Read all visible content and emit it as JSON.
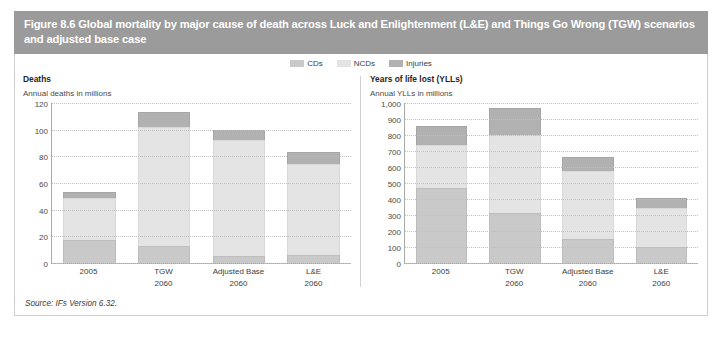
{
  "figure": {
    "header_title": "Figure 8.6 Global mortality by major cause of death across Luck and Enlightenment (L&E) and Things Go Wrong (TGW) scenarios and adjusted base case",
    "source": "Source: IFs Version 6.32.",
    "header_color": "#9b9b9b"
  },
  "legend": {
    "items": [
      {
        "label": "CDs",
        "color": "#c9c9c9"
      },
      {
        "label": "NCDs",
        "color": "#e4e4e4"
      },
      {
        "label": "Injuries",
        "color": "#b1b1b1"
      }
    ]
  },
  "chart_data": [
    {
      "type": "bar",
      "id": "deaths",
      "title": "Deaths",
      "subtitle": "Annual deaths in millions",
      "xlabel": "",
      "ylabel": "Annual deaths in millions",
      "stacked": true,
      "grid": true,
      "legend_position": "top-center",
      "ylim": [
        0,
        120
      ],
      "yticks": [
        0,
        20,
        40,
        60,
        80,
        100,
        120
      ],
      "ytick_labels": [
        "0",
        "20",
        "40",
        "60",
        "80",
        "100",
        "120"
      ],
      "categories": [
        "2005",
        "TGW",
        "Adjusted Base",
        "L&E"
      ],
      "category_sublabels": [
        "",
        "2060",
        "2060",
        "2060"
      ],
      "series": [
        {
          "name": "CDs",
          "color": "#c9c9c9",
          "values": [
            17,
            13,
            5,
            6
          ]
        },
        {
          "name": "NCDs",
          "color": "#e4e4e4",
          "values": [
            32,
            89,
            87,
            68
          ]
        },
        {
          "name": "Injuries",
          "color": "#b1b1b1",
          "values": [
            4,
            11,
            8,
            9
          ]
        }
      ],
      "totals": [
        53,
        113,
        100,
        83
      ]
    },
    {
      "type": "bar",
      "id": "ylls",
      "title": "Years of life lost (YLLs)",
      "subtitle": "Annual YLLs in millions",
      "xlabel": "",
      "ylabel": "Annual YLLs in millions",
      "stacked": true,
      "grid": true,
      "legend_position": "top-center",
      "ylim": [
        0,
        1000
      ],
      "yticks": [
        0,
        100,
        200,
        300,
        400,
        500,
        600,
        700,
        800,
        900,
        1000
      ],
      "ytick_labels": [
        "0",
        "100",
        "200",
        "300",
        "400",
        "500",
        "600",
        "700",
        "800",
        "900",
        "1,000"
      ],
      "categories": [
        "2005",
        "TGW",
        "Adjusted Base",
        "L&E"
      ],
      "category_sublabels": [
        "",
        "2060",
        "2060",
        "2060"
      ],
      "series": [
        {
          "name": "CDs",
          "color": "#c9c9c9",
          "values": [
            470,
            310,
            150,
            100
          ]
        },
        {
          "name": "NCDs",
          "color": "#e4e4e4",
          "values": [
            270,
            490,
            425,
            245
          ]
        },
        {
          "name": "Injuries",
          "color": "#b1b1b1",
          "values": [
            115,
            170,
            85,
            60
          ]
        }
      ],
      "totals": [
        855,
        970,
        660,
        405
      ]
    }
  ]
}
